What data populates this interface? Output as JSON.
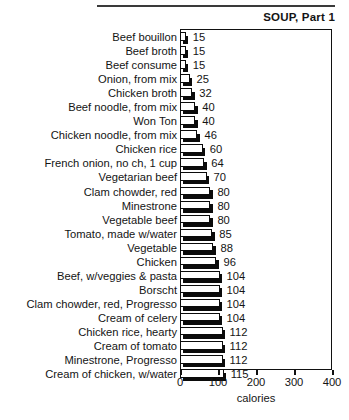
{
  "chart_data": {
    "type": "bar",
    "orientation": "horizontal",
    "title": "SOUP, Part 1",
    "xlabel": "calories",
    "ylabel": "",
    "xlim": [
      0,
      400
    ],
    "xticks": [
      0,
      100,
      200,
      300,
      400
    ],
    "grid": false,
    "legend": null,
    "categories": [
      "Beef bouillon",
      "Beef broth",
      "Beef consume",
      "Onion, from mix",
      "Chicken broth",
      "Beef noodle, from mix",
      "Won Ton",
      "Chicken noodle, from mix",
      "Chicken rice",
      "French onion, no ch, 1 cup",
      "Vegetarian beef",
      "Clam chowder, red",
      "Minestrone",
      "Vegetable beef",
      "Tomato, made w/water",
      "Vegetable",
      "Chicken",
      "Beef, w/veggies & pasta",
      "Borscht",
      "Clam chowder, red, Progresso",
      "Cream of celery",
      "Chicken rice, hearty",
      "Cream of tomato",
      "Minestrone, Progresso",
      "Cream of chicken, w/water"
    ],
    "values": [
      15,
      15,
      15,
      25,
      32,
      40,
      40,
      46,
      60,
      64,
      70,
      80,
      80,
      80,
      85,
      88,
      96,
      104,
      104,
      104,
      104,
      112,
      112,
      112,
      115
    ],
    "value_labels": [
      "15",
      "15",
      "15",
      "25",
      "32",
      "40",
      "40",
      "46",
      "60",
      "64",
      "70",
      "80",
      "80",
      "80",
      "85",
      "88",
      "96",
      "104",
      "104",
      "104",
      "104",
      "112",
      "112",
      "112",
      "115"
    ]
  },
  "style": {
    "bar_face_color": "#ffffff",
    "bar_edge_color": "#0b0b0b",
    "bar_shadow_color": "#0b0b0b",
    "axis_color": "#111111",
    "text_color": "#141414",
    "background": "#ffffff"
  },
  "header": {
    "rule_visible": true
  }
}
